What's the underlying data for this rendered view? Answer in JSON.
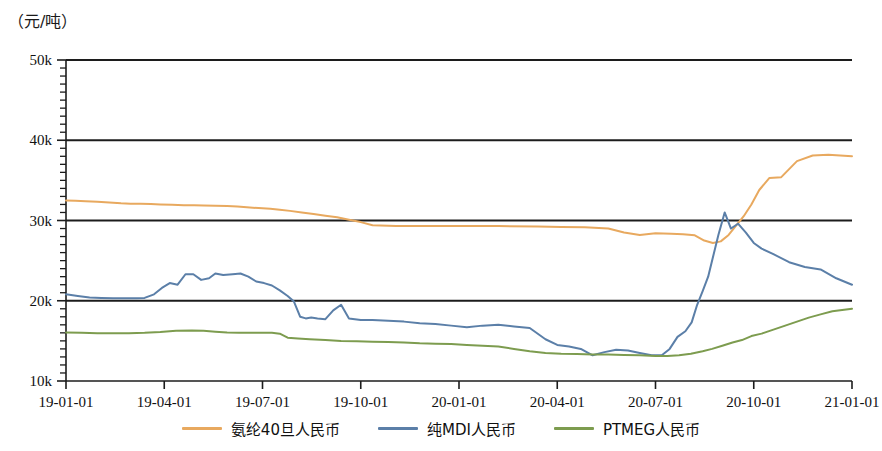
{
  "chart_data": {
    "type": "line",
    "title": "",
    "ylabel": "（元/吨）",
    "xlabel": "",
    "ylim": [
      10000,
      50000
    ],
    "grid": true,
    "grid_axis": "y",
    "legend_position": "bottom",
    "y_ticks": [
      10000,
      20000,
      30000,
      40000,
      50000
    ],
    "y_tick_labels": [
      "10k",
      "20k",
      "30k",
      "40k",
      "50k"
    ],
    "y_minor_ticks_per_interval": 10,
    "x_ticks": [
      "19-01-01",
      "19-04-01",
      "19-07-01",
      "19-10-01",
      "20-01-01",
      "20-04-01",
      "20-07-01",
      "20-10-01",
      "21-01-01"
    ],
    "x_tick_labels": [
      "19-01-01",
      "19-04-01",
      "19-07-01",
      "19-10-01",
      "20-01-01",
      "20-04-01",
      "20-07-01",
      "20-10-01",
      "21-01-01"
    ],
    "x_range": [
      "19-01-01",
      "21-01-01"
    ],
    "series": [
      {
        "name": "氨纶40旦人民币",
        "color": "#e8a95f",
        "x": [
          0,
          0.012,
          0.025,
          0.04,
          0.055,
          0.07,
          0.082,
          0.095,
          0.108,
          0.12,
          0.135,
          0.15,
          0.163,
          0.175,
          0.19,
          0.205,
          0.218,
          0.23,
          0.245,
          0.26,
          0.272,
          0.285,
          0.3,
          0.315,
          0.33,
          0.345,
          0.36,
          0.375,
          0.39,
          0.42,
          0.45,
          0.5,
          0.55,
          0.6,
          0.63,
          0.66,
          0.69,
          0.71,
          0.73,
          0.75,
          0.77,
          0.785,
          0.8,
          0.812,
          0.823,
          0.833,
          0.843,
          0.852,
          0.862,
          0.872,
          0.882,
          0.895,
          0.91,
          0.93,
          0.95,
          0.97,
          1.0
        ],
        "values": [
          32500,
          32450,
          32400,
          32350,
          32250,
          32150,
          32100,
          32080,
          32050,
          32000,
          31950,
          31900,
          31900,
          31880,
          31850,
          31800,
          31750,
          31650,
          31550,
          31450,
          31350,
          31200,
          31000,
          30800,
          30600,
          30400,
          30100,
          29800,
          29400,
          29300,
          29300,
          29300,
          29300,
          29250,
          29200,
          29150,
          29000,
          28500,
          28200,
          28400,
          28350,
          28300,
          28150,
          27500,
          27200,
          27400,
          28200,
          29300,
          30500,
          32000,
          33800,
          35300,
          35400,
          37400,
          38100,
          38200,
          38000
        ],
        "units": "元/吨"
      },
      {
        "name": "纯MDI人民币",
        "color": "#5b7fa8",
        "x": [
          0,
          0.015,
          0.03,
          0.045,
          0.06,
          0.075,
          0.09,
          0.1,
          0.112,
          0.122,
          0.132,
          0.142,
          0.152,
          0.162,
          0.172,
          0.182,
          0.19,
          0.2,
          0.212,
          0.222,
          0.232,
          0.242,
          0.252,
          0.262,
          0.272,
          0.282,
          0.29,
          0.298,
          0.305,
          0.312,
          0.32,
          0.33,
          0.34,
          0.35,
          0.36,
          0.375,
          0.39,
          0.41,
          0.43,
          0.45,
          0.47,
          0.49,
          0.51,
          0.53,
          0.55,
          0.57,
          0.59,
          0.61,
          0.625,
          0.64,
          0.655,
          0.67,
          0.685,
          0.7,
          0.715,
          0.73,
          0.745,
          0.758,
          0.768,
          0.778,
          0.788,
          0.796,
          0.803,
          0.81,
          0.817,
          0.824,
          0.83,
          0.838,
          0.846,
          0.855,
          0.865,
          0.875,
          0.885,
          0.9,
          0.92,
          0.94,
          0.96,
          0.98,
          1.0
        ],
        "values": [
          20800,
          20600,
          20400,
          20350,
          20300,
          20300,
          20300,
          20350,
          20800,
          21600,
          22200,
          22000,
          23300,
          23300,
          22600,
          22800,
          23400,
          23200,
          23300,
          23400,
          23000,
          22400,
          22200,
          21900,
          21300,
          20600,
          19900,
          18000,
          17800,
          17900,
          17800,
          17700,
          18800,
          19500,
          17800,
          17600,
          17600,
          17500,
          17400,
          17200,
          17100,
          16900,
          16700,
          16900,
          17000,
          16800,
          16600,
          15200,
          14500,
          14300,
          14000,
          13200,
          13600,
          13900,
          13800,
          13500,
          13200,
          13200,
          14000,
          15500,
          16200,
          17300,
          19500,
          21200,
          23000,
          25800,
          28200,
          31000,
          29000,
          29600,
          28500,
          27200,
          26500,
          25800,
          24800,
          24200,
          23900,
          22800,
          22000
        ],
        "units": "元/吨"
      },
      {
        "name": "PTMEG人民币",
        "color": "#7d9c4f",
        "x": [
          0,
          0.02,
          0.04,
          0.06,
          0.08,
          0.1,
          0.12,
          0.14,
          0.16,
          0.175,
          0.19,
          0.205,
          0.22,
          0.235,
          0.25,
          0.262,
          0.272,
          0.282,
          0.295,
          0.31,
          0.33,
          0.35,
          0.37,
          0.39,
          0.41,
          0.43,
          0.45,
          0.47,
          0.49,
          0.51,
          0.53,
          0.55,
          0.57,
          0.59,
          0.61,
          0.63,
          0.65,
          0.67,
          0.69,
          0.71,
          0.73,
          0.75,
          0.765,
          0.78,
          0.795,
          0.81,
          0.822,
          0.835,
          0.848,
          0.86,
          0.872,
          0.885,
          0.9,
          0.915,
          0.93,
          0.945,
          0.96,
          0.975,
          1.0
        ],
        "values": [
          16050,
          16000,
          15950,
          15950,
          15950,
          16000,
          16100,
          16250,
          16300,
          16250,
          16150,
          16050,
          16000,
          16000,
          16000,
          16000,
          15900,
          15400,
          15300,
          15200,
          15100,
          15000,
          14950,
          14900,
          14850,
          14800,
          14700,
          14650,
          14600,
          14500,
          14400,
          14300,
          14000,
          13700,
          13500,
          13400,
          13350,
          13300,
          13300,
          13250,
          13200,
          13100,
          13100,
          13200,
          13400,
          13700,
          14000,
          14400,
          14800,
          15100,
          15600,
          15900,
          16400,
          16900,
          17400,
          17900,
          18300,
          18700,
          19000
        ],
        "units": "元/吨"
      }
    ]
  },
  "legend": {
    "items": [
      {
        "label": "氨纶40旦人民币",
        "color": "#e8a95f"
      },
      {
        "label": "纯MDI人民币",
        "color": "#5b7fa8"
      },
      {
        "label": "PTMEG人民币",
        "color": "#7d9c4f"
      }
    ]
  }
}
